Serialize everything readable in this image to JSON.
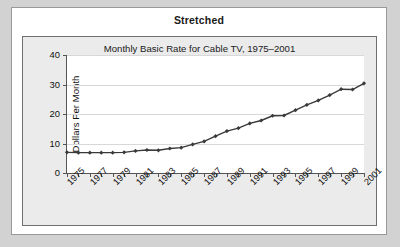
{
  "panel": {
    "header": "Stretched"
  },
  "chart_data": {
    "type": "line",
    "title": "Monthly Basic Rate for Cable TV, 1975–2001",
    "xlabel": "",
    "ylabel": "Dollars Per Month",
    "ylim": [
      0,
      40
    ],
    "yticks": [
      0,
      10,
      20,
      30,
      40
    ],
    "ytick_labels": [
      "0",
      "10",
      "20",
      "30",
      "40"
    ],
    "xlim": [
      1975,
      2001
    ],
    "xtick_labels": [
      "1975",
      "1977",
      "1979",
      "1981",
      "1983",
      "1985",
      "1987",
      "1989",
      "1991",
      "1993",
      "1995",
      "1997",
      "1999",
      "2001"
    ],
    "grid": "horizontal",
    "legend": "none",
    "marker": "diamond",
    "line_color": "#3a3a3a",
    "grid_color": "#d8d8d8",
    "plot_background": "#ffffff",
    "x": [
      1975,
      1976,
      1977,
      1978,
      1979,
      1980,
      1981,
      1982,
      1983,
      1984,
      1985,
      1986,
      1987,
      1988,
      1989,
      1990,
      1991,
      1992,
      1993,
      1994,
      1995,
      1996,
      1997,
      1998,
      1999,
      2000,
      2001
    ],
    "values": [
      7.0,
      6.9,
      6.9,
      6.9,
      6.9,
      7.0,
      7.5,
      7.8,
      7.7,
      8.3,
      8.6,
      9.7,
      10.7,
      12.5,
      14.2,
      15.2,
      16.8,
      17.8,
      19.4,
      19.5,
      21.3,
      23.1,
      24.6,
      26.4,
      28.4,
      28.3,
      30.4
    ],
    "series": [
      {
        "name": "Monthly Basic Rate",
        "values": [
          7.0,
          6.9,
          6.9,
          6.9,
          6.9,
          7.0,
          7.5,
          7.8,
          7.7,
          8.3,
          8.6,
          9.7,
          10.7,
          12.5,
          14.2,
          15.2,
          16.8,
          17.8,
          19.4,
          19.5,
          21.3,
          23.1,
          24.6,
          26.4,
          28.4,
          28.3,
          30.4
        ]
      }
    ]
  }
}
